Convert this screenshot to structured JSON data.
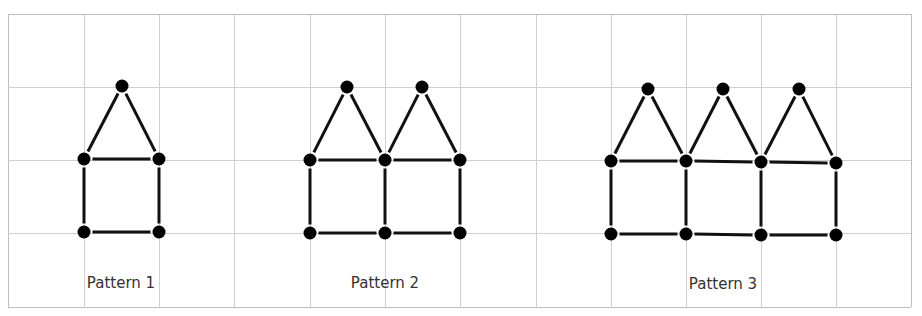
{
  "figure": {
    "grid": {
      "x_lines": [
        8,
        84,
        159,
        234,
        310,
        385,
        460,
        536,
        611,
        686,
        761,
        836,
        911
      ],
      "y_lines": [
        14,
        87,
        160,
        233,
        307
      ],
      "line_color": "#cfcfcf",
      "border_color": "#bdbdbd"
    },
    "style": {
      "dot_color": "#000000",
      "dot_radius": 6.5,
      "edge_color": "#111111",
      "edge_width": 3
    },
    "patterns": [
      {
        "label": "Pattern 1",
        "label_x": 121,
        "houses": 1,
        "dots": [
          [
            122,
            86
          ],
          [
            84,
            159
          ],
          [
            159,
            159
          ],
          [
            84,
            232
          ],
          [
            159,
            232
          ]
        ],
        "edges": [
          [
            0,
            1
          ],
          [
            0,
            2
          ],
          [
            1,
            2
          ],
          [
            1,
            3
          ],
          [
            2,
            4
          ],
          [
            3,
            4
          ]
        ]
      },
      {
        "label": "Pattern 2",
        "label_x": 385,
        "houses": 2,
        "dots": [
          [
            347,
            87
          ],
          [
            422,
            87
          ],
          [
            310,
            160
          ],
          [
            385,
            160
          ],
          [
            460,
            160
          ],
          [
            310,
            233
          ],
          [
            385,
            233
          ],
          [
            460,
            233
          ]
        ],
        "edges": [
          [
            0,
            2
          ],
          [
            0,
            3
          ],
          [
            1,
            3
          ],
          [
            1,
            4
          ],
          [
            2,
            3
          ],
          [
            3,
            4
          ],
          [
            2,
            5
          ],
          [
            3,
            6
          ],
          [
            4,
            7
          ],
          [
            5,
            6
          ],
          [
            6,
            7
          ]
        ]
      },
      {
        "label": "Pattern 3",
        "label_x": 723,
        "houses": 3,
        "dots": [
          [
            648,
            89
          ],
          [
            723,
            89
          ],
          [
            799,
            89
          ],
          [
            611,
            161
          ],
          [
            686,
            161
          ],
          [
            761,
            162
          ],
          [
            836,
            163
          ],
          [
            611,
            234
          ],
          [
            686,
            234
          ],
          [
            761,
            235
          ],
          [
            836,
            235
          ]
        ],
        "edges": [
          [
            0,
            3
          ],
          [
            0,
            4
          ],
          [
            1,
            4
          ],
          [
            1,
            5
          ],
          [
            2,
            5
          ],
          [
            2,
            6
          ],
          [
            3,
            4
          ],
          [
            4,
            5
          ],
          [
            5,
            6
          ],
          [
            3,
            7
          ],
          [
            4,
            8
          ],
          [
            5,
            9
          ],
          [
            6,
            10
          ],
          [
            7,
            8
          ],
          [
            8,
            9
          ],
          [
            9,
            10
          ]
        ]
      }
    ]
  }
}
